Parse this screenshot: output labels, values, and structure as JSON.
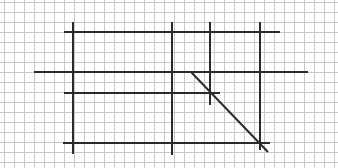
{
  "figure": {
    "width": 338,
    "height": 168,
    "background": "#ffffff",
    "grid": {
      "spacing": 10,
      "offset_x": 4,
      "offset_y": 2,
      "color": "#c8c8c8"
    },
    "line_color": "#2a2a2a",
    "vertical_lines": [
      {
        "x": 73,
        "y1": 22,
        "y2": 154
      },
      {
        "x": 172,
        "y1": 22,
        "y2": 155
      },
      {
        "x": 210,
        "y1": 22,
        "y2": 105
      },
      {
        "x": 260,
        "y1": 22,
        "y2": 150
      }
    ],
    "horizontal_lines": [
      {
        "y": 32,
        "x1": 64,
        "x2": 280
      },
      {
        "y": 72,
        "x1": 34,
        "x2": 308
      },
      {
        "y": 93,
        "x1": 64,
        "x2": 220
      },
      {
        "y": 143,
        "x1": 63,
        "x2": 270
      }
    ],
    "diagonal_lines": [
      {
        "x1": 191,
        "y1": 72,
        "x2": 268,
        "y2": 152
      }
    ]
  }
}
